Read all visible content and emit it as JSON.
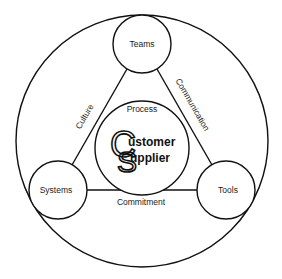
{
  "diagram": {
    "nodes": {
      "top": {
        "label": "Teams"
      },
      "left": {
        "label": "Systems"
      },
      "right": {
        "label": "Tools"
      },
      "center": {
        "label": "Process"
      }
    },
    "edges": {
      "left": {
        "label": "Culture"
      },
      "right": {
        "label": "Communication"
      },
      "bottom": {
        "label": "Commitment"
      }
    },
    "logo": {
      "letter1": "C",
      "letter2": "S",
      "word1": "ustomer",
      "word2": "upplier"
    },
    "colors": {
      "stroke": "#111111",
      "background": "#ffffff"
    }
  }
}
